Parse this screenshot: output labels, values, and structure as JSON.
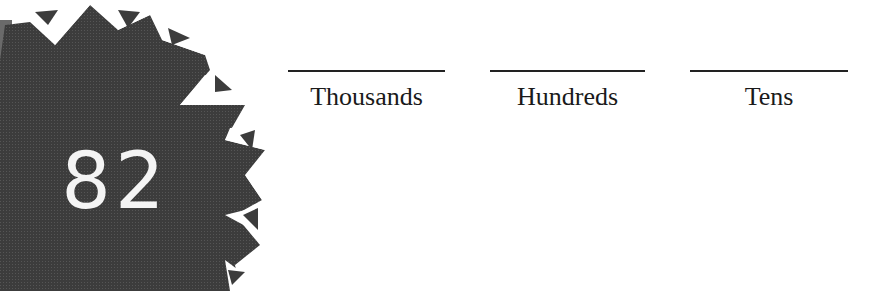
{
  "badge": {
    "number": "82",
    "fill_color": "#3a3a3a",
    "accent_color": "#ffffff"
  },
  "place_values": [
    {
      "label": "Thousands",
      "x": 288,
      "width": 157
    },
    {
      "label": "Hundreds",
      "x": 490,
      "width": 155
    },
    {
      "label": "Tens",
      "x": 690,
      "width": 158
    }
  ]
}
